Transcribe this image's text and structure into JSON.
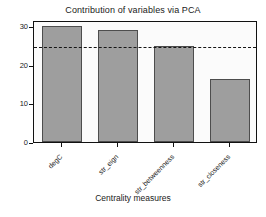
{
  "chart_data": {
    "type": "bar",
    "title": "Contribution of variables via PCA",
    "xlabel": "Centrality measures",
    "ylabel": "Contributions",
    "categories": [
      "degC",
      "str_eign",
      "str_betweenness",
      "str_closeness"
    ],
    "values": [
      30.0,
      28.9,
      24.7,
      16.2
    ],
    "ylim": [
      0,
      31.5
    ],
    "yticks": [
      0,
      10,
      20,
      30
    ],
    "ytick_labels": [
      "0",
      "10",
      "20",
      "30"
    ],
    "grid": false,
    "legend": "none",
    "annotations": [
      {
        "type": "hline",
        "name": "expected-average-contribution",
        "value": 25,
        "style": "dashed",
        "color": "#151515"
      }
    ],
    "bar_fill": "#9e9e9e",
    "bar_border": "#4d4d4d",
    "panel_background": "#fbfbfb",
    "figure_background": "#ffffff",
    "xlabel_rotation": -45
  }
}
